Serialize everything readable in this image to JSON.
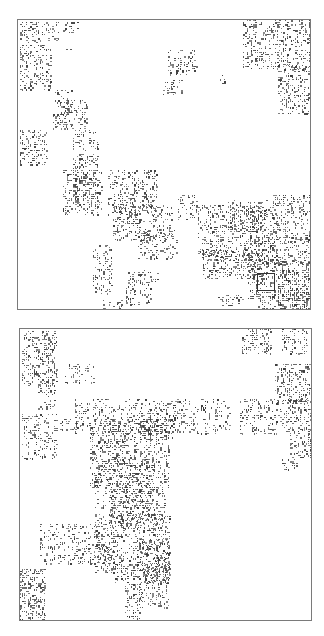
{
  "figure": {
    "background": "#ffffff",
    "frame_color": "#7a7a7a",
    "cell_color": "#3a3a3a",
    "panels": [
      {
        "id": "top",
        "box": {
          "x": 17,
          "y": 19,
          "w": 294,
          "h": 291
        },
        "marker": {
          "x": 239,
          "y": 253,
          "w": 18,
          "h": 18
        },
        "clusters": [
          [
            2,
            2,
            40,
            22,
            0.35
          ],
          [
            45,
            2,
            15,
            12,
            0.3
          ],
          [
            2,
            25,
            32,
            45,
            0.35
          ],
          [
            48,
            25,
            8,
            6,
            0.3
          ],
          [
            35,
            70,
            20,
            40,
            0.3
          ],
          [
            40,
            80,
            30,
            30,
            0.3
          ],
          [
            2,
            110,
            28,
            35,
            0.4
          ],
          [
            55,
            110,
            25,
            70,
            0.3
          ],
          [
            45,
            150,
            40,
            45,
            0.35
          ],
          [
            90,
            150,
            50,
            45,
            0.35
          ],
          [
            150,
            30,
            30,
            25,
            0.25
          ],
          [
            145,
            60,
            20,
            15,
            0.3
          ],
          [
            200,
            55,
            8,
            12,
            0.3
          ],
          [
            225,
            0,
            69,
            50,
            0.35
          ],
          [
            260,
            45,
            34,
            50,
            0.35
          ],
          [
            95,
            185,
            60,
            35,
            0.35
          ],
          [
            120,
            210,
            40,
            30,
            0.3
          ],
          [
            160,
            175,
            20,
            25,
            0.25
          ],
          [
            180,
            185,
            80,
            55,
            0.35
          ],
          [
            210,
            180,
            40,
            30,
            0.3
          ],
          [
            255,
            175,
            39,
            45,
            0.35
          ],
          [
            230,
            215,
            64,
            30,
            0.35
          ],
          [
            185,
            230,
            60,
            30,
            0.35
          ],
          [
            230,
            240,
            64,
            40,
            0.35
          ],
          [
            260,
            250,
            34,
            41,
            0.35
          ],
          [
            75,
            225,
            20,
            50,
            0.3
          ],
          [
            108,
            250,
            25,
            35,
            0.35
          ],
          [
            133,
            253,
            10,
            10,
            0.3
          ],
          [
            200,
            275,
            25,
            16,
            0.25
          ],
          [
            240,
            270,
            54,
            21,
            0.35
          ],
          [
            85,
            280,
            20,
            11,
            0.3
          ]
        ]
      },
      {
        "id": "bottom",
        "box": {
          "x": 19,
          "y": 328,
          "w": 293,
          "h": 293
        },
        "marker": null,
        "clusters": [
          [
            2,
            2,
            35,
            55,
            0.4
          ],
          [
            45,
            35,
            30,
            20,
            0.3
          ],
          [
            18,
            55,
            18,
            25,
            0.3
          ],
          [
            2,
            85,
            35,
            45,
            0.3
          ],
          [
            38,
            90,
            25,
            12,
            0.3
          ],
          [
            55,
            70,
            155,
            35,
            0.25
          ],
          [
            70,
            90,
            80,
            70,
            0.35
          ],
          [
            120,
            80,
            35,
            30,
            0.3
          ],
          [
            75,
            130,
            60,
            50,
            0.3
          ],
          [
            90,
            160,
            55,
            40,
            0.35
          ],
          [
            75,
            185,
            75,
            60,
            0.35
          ],
          [
            120,
            210,
            30,
            70,
            0.35
          ],
          [
            20,
            195,
            60,
            25,
            0.3
          ],
          [
            20,
            218,
            75,
            18,
            0.25
          ],
          [
            95,
            235,
            55,
            20,
            0.3
          ],
          [
            0,
            240,
            25,
            53,
            0.45
          ],
          [
            105,
            255,
            18,
            38,
            0.4
          ],
          [
            222,
            0,
            30,
            25,
            0.35
          ],
          [
            262,
            0,
            26,
            25,
            0.35
          ],
          [
            255,
            35,
            38,
            40,
            0.4
          ],
          [
            220,
            70,
            50,
            35,
            0.3
          ],
          [
            270,
            70,
            23,
            60,
            0.4
          ],
          [
            262,
            130,
            15,
            12,
            0.35
          ]
        ]
      }
    ]
  }
}
